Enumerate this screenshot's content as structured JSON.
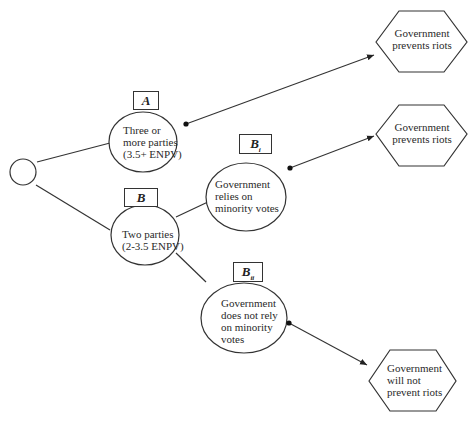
{
  "diagram": {
    "type": "decision-tree",
    "root": {
      "id": "root",
      "label": ""
    },
    "labels": {
      "A": "A",
      "B": "B",
      "Bi_main": "B",
      "Bi_sub": "i",
      "Bii_main": "B",
      "Bii_sub": "ii"
    },
    "nodes": {
      "three_parties": {
        "lines": [
          "Three or",
          "more parties",
          "(3.5+ ENPV)"
        ]
      },
      "two_parties": {
        "lines": [
          "Two parties",
          "(2-3.5 ENPV)"
        ]
      },
      "relies_minority": {
        "lines": [
          "Government",
          "relies on",
          "minority votes"
        ]
      },
      "not_rely_minority": {
        "lines": [
          "Government",
          "does not rely",
          "on minority",
          "votes"
        ]
      }
    },
    "outcomes": {
      "top": {
        "lines": [
          "Government",
          "prevents riots"
        ]
      },
      "middle": {
        "lines": [
          "Government",
          "prevents riots"
        ]
      },
      "bottom": {
        "lines": [
          "Government",
          "will not",
          "prevent riots"
        ]
      }
    },
    "edges": [
      {
        "from": "root",
        "to": "three_parties",
        "style": "line"
      },
      {
        "from": "root",
        "to": "two_parties",
        "style": "line"
      },
      {
        "from": "two_parties",
        "to": "relies_minority",
        "style": "line"
      },
      {
        "from": "two_parties",
        "to": "not_rely_minority",
        "style": "line"
      },
      {
        "from": "three_parties",
        "to": "outcome_top",
        "style": "arrow"
      },
      {
        "from": "relies_minority",
        "to": "outcome_middle",
        "style": "arrow"
      },
      {
        "from": "not_rely_minority",
        "to": "outcome_bottom",
        "style": "arrow"
      }
    ]
  }
}
